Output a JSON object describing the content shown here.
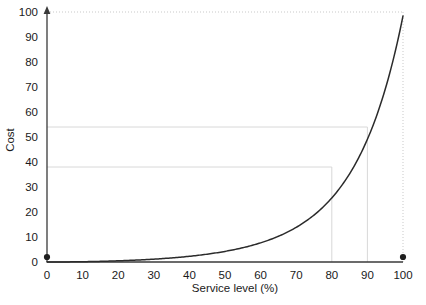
{
  "chart_data": {
    "type": "line",
    "title": "",
    "xlabel": "Service level (%)",
    "ylabel": "Cost",
    "xlim": [
      0,
      100
    ],
    "ylim": [
      0,
      100
    ],
    "grid": true,
    "legend_position": "none",
    "x_ticks": [
      "0",
      "10",
      "20",
      "30",
      "40",
      "50",
      "60",
      "70",
      "80",
      "90",
      "100"
    ],
    "y_ticks": [
      "0",
      "10",
      "20",
      "30",
      "40",
      "50",
      "60",
      "70",
      "80",
      "90",
      "100"
    ],
    "x_tick_values": [
      0,
      10,
      20,
      30,
      40,
      50,
      60,
      70,
      80,
      90,
      100
    ],
    "y_tick_values": [
      0,
      10,
      20,
      30,
      40,
      50,
      60,
      70,
      80,
      90,
      100
    ],
    "series": [
      {
        "name": "Cost curve",
        "x": [
          0,
          5,
          10,
          15,
          20,
          25,
          30,
          35,
          40,
          45,
          50,
          55,
          60,
          65,
          70,
          75,
          80,
          85,
          90,
          95,
          98,
          100
        ],
        "values": [
          -2.5,
          -1.0,
          0.5,
          2.2,
          4.0,
          6.0,
          8.2,
          10.6,
          13.2,
          16.0,
          19.0,
          22.3,
          26.0,
          30.0,
          34.5,
          39.8,
          38.0,
          46.0,
          54.0,
          68.0,
          82.0,
          100.0
        ],
        "color": "#2b2b2b",
        "style": "solid"
      }
    ],
    "annotations": [
      {
        "type": "hline",
        "y": 54,
        "x_from": 0,
        "x_to": 90,
        "style": "solid-light",
        "label": ""
      },
      {
        "type": "hline",
        "y": 38,
        "x_from": 0,
        "x_to": 80,
        "style": "solid-light",
        "label": ""
      },
      {
        "type": "vline",
        "x": 90,
        "y_from": 0,
        "y_to": 54,
        "style": "solid-light",
        "label": ""
      },
      {
        "type": "vline",
        "x": 80,
        "y_from": 0,
        "y_to": 38,
        "style": "solid-light",
        "label": ""
      },
      {
        "type": "hline",
        "y": 100,
        "x_from": 0,
        "x_to": 100,
        "style": "dotted",
        "label": ""
      },
      {
        "type": "vline",
        "x": 100,
        "y_from": 0,
        "y_to": 100,
        "style": "dotted",
        "label": ""
      }
    ],
    "markers": [
      {
        "x": 0,
        "y": 2,
        "shape": "dot",
        "color": "#1f1f1f"
      },
      {
        "x": 100,
        "y": 2,
        "shape": "dot",
        "color": "#1f1f1f"
      }
    ],
    "axis_style": {
      "y_axis_arrow": true,
      "x_axis_arrow": false,
      "axis_color": "#3a3a3a",
      "grid_color": "#d8d8d8"
    }
  }
}
